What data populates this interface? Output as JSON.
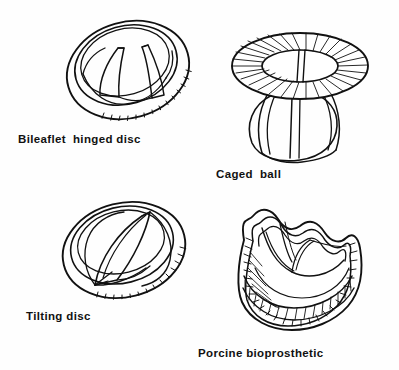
{
  "figure": {
    "background_color": "#fefefe",
    "ink_color": "#111111",
    "width": 399,
    "height": 370,
    "style": "line drawing, pen and ink, black on white"
  },
  "panels": [
    {
      "id": "bileaflet",
      "caption": "Bileaflet  hinged disc",
      "position": "top-left",
      "caption_x": 18,
      "caption_y": 133,
      "description": "Oval sewing ring shown in oblique view with hatched fabric cuff and two curved semicircular leaflets meeting in a central V",
      "parts": [
        "sewing ring",
        "hatched cloth cuff",
        "leaflet left",
        "leaflet right",
        "hinge line"
      ]
    },
    {
      "id": "caged-ball",
      "caption": "Caged  ball",
      "position": "top-right",
      "caption_x": 216,
      "caption_y": 168,
      "description": "Torus sewing ring with radial suture stitching around inner and outer margins, a ball occluder suspended below inside three wire struts",
      "parts": [
        "sewing ring torus",
        "radial stitching",
        "strut left",
        "strut center",
        "strut right",
        "ball occluder"
      ]
    },
    {
      "id": "tilting-disc",
      "caption": "Tilting disc",
      "position": "bottom-left",
      "caption_x": 26,
      "caption_y": 310,
      "description": "Oval ring in oblique view with a single flat disc tilted open on a diagonal axis, hatched cuff along the lower right rim",
      "parts": [
        "sewing ring",
        "hatched cloth cuff",
        "tilting disc",
        "pivot strut"
      ]
    },
    {
      "id": "porcine",
      "caption": "Porcine bioprosthetic",
      "position": "bottom-right",
      "caption_x": 198,
      "caption_y": 347,
      "description": "Scalloped three-post crown stent covered in hatched cloth, with pig aortic valve cusps forming the inner leaflets",
      "parts": [
        "stent post left",
        "stent post center",
        "stent post right",
        "cloth covered base",
        "cusp left",
        "cusp right",
        "scalloped suture ring"
      ]
    }
  ]
}
